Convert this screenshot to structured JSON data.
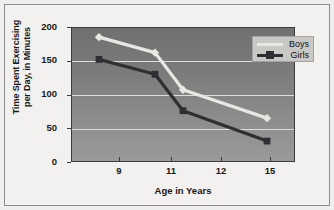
{
  "chart_data": {
    "type": "line",
    "title": "",
    "xlabel": "Age in Years",
    "ylabel": "Time Spent Exercising per Day, in Minutes",
    "ylabel_line1": "Time Spent Exercising",
    "ylabel_line2": "per Day, in Minutes",
    "categories": [
      "9",
      "11",
      "12",
      "15"
    ],
    "x": [
      9,
      11,
      12,
      15
    ],
    "xlim": [
      8,
      16
    ],
    "ylim": [
      0,
      200
    ],
    "ytick_labels": [
      "200",
      "150",
      "100",
      "50",
      "0"
    ],
    "yticks": [
      200,
      150,
      100,
      50,
      0
    ],
    "grid": true,
    "legend_position": "top-right",
    "series": [
      {
        "name": "Boys",
        "values": [
          185,
          162,
          107,
          65
        ],
        "color": "#e8e7e2",
        "marker": "diamond"
      },
      {
        "name": "Girls",
        "values": [
          152,
          130,
          76,
          31
        ],
        "color": "#2f2f33",
        "marker": "square"
      }
    ]
  },
  "legend": {
    "items": [
      {
        "label": "Boys",
        "color": "#e8e7e2"
      },
      {
        "label": "Girls",
        "color": "#2f2f33"
      }
    ]
  },
  "colors": {
    "page_background": "#efeeec",
    "figure_background": "#f2f1ef",
    "plot_background": "#838383",
    "gridline": "#ddddd9",
    "axis": "#3c3c3c",
    "text": "#19191a",
    "legend_background": "#c9c8c4"
  }
}
